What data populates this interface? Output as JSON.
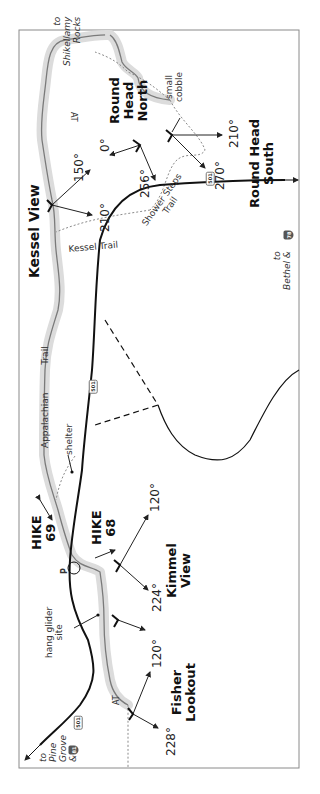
{
  "map": {
    "frame": {
      "left": 19,
      "top": 30,
      "right": 299,
      "bottom": 768,
      "stroke": "#888888"
    },
    "colors": {
      "trail_halo": "#d9d9d9",
      "trail_line": "#7a7a7a",
      "road": "#111111",
      "dotted": "#8a8a8a",
      "text": "#222222"
    },
    "hikes": [
      {
        "label": "HIKE",
        "number": "69"
      },
      {
        "label": "HIKE",
        "number": "68"
      }
    ],
    "viewpoints": [
      {
        "name": "Round Head North",
        "line1": "Round",
        "line2": "Head",
        "line3": "North",
        "bearings": [
          "0°",
          "256°"
        ]
      },
      {
        "name": "Round Head South",
        "line1": "Round Head",
        "line2": "South",
        "bearings": [
          "210°",
          "270°"
        ]
      },
      {
        "name": "Kessel View",
        "line1": "Kessel View",
        "bearings": [
          "150°",
          "210°"
        ]
      },
      {
        "name": "Kimmel View",
        "line1": "Kimmel",
        "line2": "View",
        "bearings": [
          "120°",
          "224°"
        ]
      },
      {
        "name": "Fisher Lookout",
        "line1": "Fisher",
        "line2": "Lookout",
        "bearings": [
          "120°",
          "228°"
        ]
      }
    ],
    "labels": {
      "to_shikellamy": [
        "to",
        "Shikellamy",
        "Rocks"
      ],
      "small_cobble": [
        "small",
        "cobble"
      ],
      "at_top": "AT",
      "at_bottom": "AT",
      "shower_steps_trail": [
        "Shower",
        "Steps",
        "Trail"
      ],
      "kessel_trail": "Kessel Trail",
      "appalachian_trail": [
        "Appalachian",
        "Trail"
      ],
      "shelter": "shelter",
      "hang_glider": [
        "hang glider",
        "site"
      ],
      "parking": "P",
      "to_bethel": [
        "to",
        "Bethel &"
      ],
      "to_pine_grove": [
        "to",
        "Pine",
        "Grove",
        "&"
      ]
    },
    "roads": {
      "route_501": "501",
      "interstate_bethel": "78",
      "interstate_pine_grove": "81"
    }
  }
}
